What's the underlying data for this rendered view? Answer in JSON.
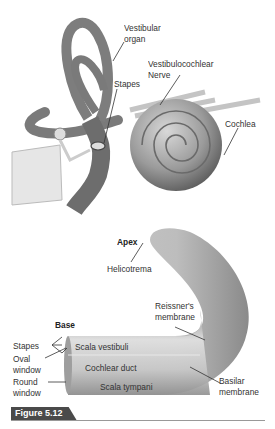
{
  "top_diagram": {
    "labels": {
      "vestibular_organ": "Vestibular\norgan",
      "vestibulocochlear_nerve": "Vestibulocochlear\nNerve",
      "stapes": "Stapes",
      "cochlea": "Cochlea"
    }
  },
  "bottom_diagram": {
    "labels": {
      "apex": "Apex",
      "helicotrema": "Helicotrema",
      "reissners_membrane": "Reissner's\nmembrane",
      "base": "Base",
      "stapes": "Stapes",
      "oval_window": "Oval\nwindow",
      "round_window": "Round\nwindow",
      "scala_vestibuli": "Scala vestibuli",
      "cochlear_duct": "Cochlear duct",
      "scala_tympani": "Scala tympani",
      "basilar_membrane": "Basilar\nmembrane"
    }
  },
  "figure": {
    "label": "Figure 5.12",
    "label_bg": "#4a4a4a"
  },
  "colors": {
    "tissue_dark": "#5e5e5e",
    "tissue_mid": "#9a9a9a",
    "tissue_light": "#d4d4d4"
  }
}
